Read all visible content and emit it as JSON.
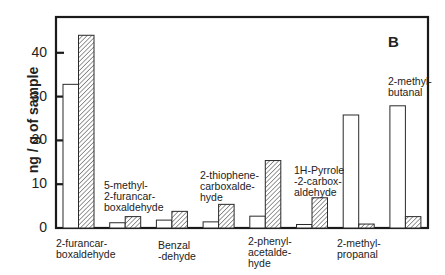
{
  "chart_data": {
    "type": "bar",
    "title": "",
    "panel_label": "B",
    "xlabel": "",
    "ylabel": "ng / g of sample",
    "ylim": [
      0,
      48
    ],
    "yticks": [
      0,
      10,
      20,
      30,
      40
    ],
    "grid": false,
    "legend": null,
    "categories": [
      "2-furancar-boxaldehyde",
      "5-methyl-2-furancar-boxaldehyde",
      "Benzal-dehyde",
      "2-thiophene-carboxalde-hyde",
      "2-phenyl-acetalde-hyde",
      "1H-Pyrrole-2-carbox-aldehyde",
      "2-methyl-propanal",
      "2-methyl-butanal"
    ],
    "series": [
      {
        "name": "open",
        "style": "white fill, black outline",
        "values": [
          32.8,
          1.2,
          1.8,
          1.4,
          2.7,
          0.8,
          25.8,
          27.9
        ]
      },
      {
        "name": "hatched",
        "style": "diagonal hatch fill",
        "values": [
          44.0,
          2.6,
          3.8,
          5.4,
          15.4,
          6.9,
          0.9,
          2.6
        ]
      }
    ]
  },
  "labels": {
    "below": [
      {
        "text": "2-furancar-\nboxaldehyde",
        "x": 56,
        "y": 238
      },
      {
        "text": "Benzal\n-dehyde",
        "x": 158,
        "y": 240
      },
      {
        "text": "2-phenyl-\nacetalde-\nhyde",
        "x": 248,
        "y": 236
      },
      {
        "text": "2-methyl-\npropanal",
        "x": 337,
        "y": 238
      }
    ],
    "above": [
      {
        "text": "5-methyl-\n2-furancar-\nboxaldehyde",
        "x": 104,
        "y": 180
      },
      {
        "text": "2-thiophene-\ncarboxalde-\nhyde",
        "x": 200,
        "y": 170
      },
      {
        "text": "1H-Pyrrole\n-2-carbox-\naldehyde",
        "x": 294,
        "y": 165
      },
      {
        "text": "2-methyl-\nbutanal",
        "x": 388,
        "y": 76
      }
    ]
  }
}
